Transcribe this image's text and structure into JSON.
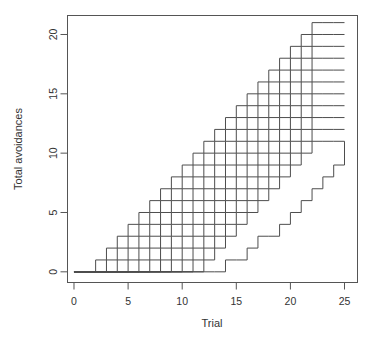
{
  "chart_data": {
    "type": "line",
    "subtype": "step",
    "title": "",
    "xlabel": "Trial",
    "ylabel": "Total avoidances",
    "xlim": [
      -0.6,
      26.2
    ],
    "ylim": [
      -0.9,
      21.6
    ],
    "xticks": [
      0,
      5,
      10,
      15,
      20,
      25
    ],
    "yticks": [
      0,
      5,
      10,
      15,
      20
    ],
    "grid": false,
    "legend": null,
    "line_color": "#4d4d4d",
    "background_color": "#ffffff",
    "axis_color": "#555555",
    "step_direction": "hv",
    "x": [
      0,
      1,
      2,
      3,
      4,
      5,
      6,
      7,
      8,
      9,
      10,
      11,
      12,
      13,
      14,
      15,
      16,
      17,
      18,
      19,
      20,
      21,
      22,
      23,
      24,
      25
    ],
    "series": [
      {
        "name": "subject-1",
        "values": [
          0,
          0,
          1,
          2,
          3,
          4,
          5,
          6,
          7,
          8,
          9,
          10,
          11,
          12,
          13,
          14,
          15,
          16,
          17,
          18,
          19,
          20,
          21,
          21,
          21,
          21
        ]
      },
      {
        "name": "subject-2",
        "values": [
          0,
          0,
          0,
          1,
          2,
          3,
          4,
          5,
          6,
          7,
          8,
          9,
          10,
          11,
          12,
          13,
          14,
          15,
          16,
          17,
          18,
          19,
          20,
          20,
          20,
          20
        ]
      },
      {
        "name": "subject-3",
        "values": [
          0,
          0,
          0,
          0,
          1,
          2,
          3,
          4,
          5,
          6,
          7,
          8,
          9,
          10,
          11,
          12,
          13,
          14,
          15,
          16,
          17,
          18,
          19,
          19,
          19,
          19
        ]
      },
      {
        "name": "subject-4",
        "values": [
          0,
          0,
          0,
          0,
          0,
          1,
          2,
          3,
          4,
          5,
          6,
          7,
          8,
          9,
          10,
          11,
          12,
          13,
          14,
          15,
          16,
          17,
          18,
          18,
          18,
          18
        ]
      },
      {
        "name": "subject-5",
        "values": [
          0,
          0,
          0,
          0,
          0,
          0,
          1,
          2,
          3,
          4,
          5,
          6,
          7,
          8,
          9,
          10,
          11,
          12,
          13,
          14,
          15,
          16,
          17,
          17,
          17,
          17
        ]
      },
      {
        "name": "subject-6",
        "values": [
          0,
          0,
          0,
          0,
          0,
          0,
          0,
          1,
          2,
          3,
          4,
          5,
          6,
          7,
          8,
          9,
          10,
          11,
          12,
          13,
          14,
          15,
          16,
          16,
          16,
          16
        ]
      },
      {
        "name": "subject-7",
        "values": [
          0,
          0,
          0,
          0,
          0,
          0,
          0,
          0,
          1,
          2,
          3,
          4,
          5,
          6,
          7,
          8,
          9,
          10,
          11,
          12,
          13,
          14,
          15,
          15,
          15,
          15
        ]
      },
      {
        "name": "subject-8",
        "values": [
          0,
          0,
          0,
          0,
          0,
          0,
          0,
          0,
          0,
          1,
          2,
          3,
          4,
          5,
          6,
          7,
          8,
          9,
          10,
          11,
          12,
          13,
          14,
          14,
          14,
          14
        ]
      },
      {
        "name": "subject-9",
        "values": [
          0,
          0,
          0,
          0,
          0,
          0,
          0,
          0,
          0,
          0,
          1,
          2,
          3,
          4,
          5,
          6,
          7,
          8,
          9,
          10,
          11,
          12,
          13,
          13,
          13,
          13
        ]
      },
      {
        "name": "subject-10",
        "values": [
          0,
          0,
          0,
          0,
          0,
          0,
          0,
          0,
          0,
          0,
          0,
          1,
          2,
          3,
          4,
          5,
          6,
          7,
          8,
          9,
          10,
          11,
          12,
          12,
          12,
          12
        ]
      },
      {
        "name": "subject-11",
        "values": [
          0,
          0,
          0,
          0,
          0,
          0,
          0,
          0,
          0,
          0,
          0,
          0,
          1,
          2,
          3,
          4,
          5,
          6,
          7,
          8,
          9,
          10,
          11,
          11,
          11,
          11
        ]
      },
      {
        "name": "subject-12",
        "values": [
          0,
          0,
          0,
          0,
          0,
          0,
          0,
          0,
          0,
          0,
          0,
          0,
          0,
          0,
          1,
          1,
          2,
          3,
          3,
          4,
          5,
          6,
          7,
          8,
          9,
          11
        ]
      }
    ]
  },
  "axes": {
    "x_tick_labels": [
      "0",
      "5",
      "10",
      "15",
      "20",
      "25"
    ],
    "y_tick_labels": [
      "0",
      "5",
      "10",
      "15",
      "20"
    ],
    "x_axis_title": "Trial",
    "y_axis_title": "Total avoidances"
  }
}
